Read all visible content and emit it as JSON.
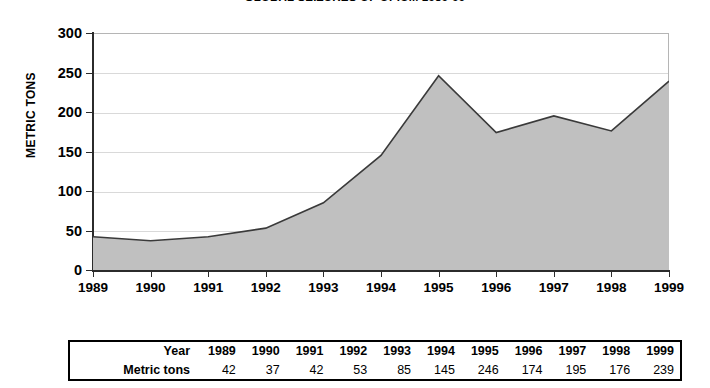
{
  "chart_data": {
    "type": "area",
    "title": "GLOBAL SEIZURES OF OPIUM 1989-99",
    "xlabel": "",
    "ylabel": "METRIC TONS",
    "categories": [
      "1989",
      "1990",
      "1991",
      "1992",
      "1993",
      "1994",
      "1995",
      "1996",
      "1997",
      "1998",
      "1999"
    ],
    "values": [
      42,
      37,
      42,
      53,
      85,
      145,
      246,
      174,
      195,
      176,
      239
    ],
    "series": [
      {
        "name": "Metric tons",
        "values": [
          42,
          37,
          42,
          53,
          85,
          145,
          246,
          174,
          195,
          176,
          239
        ]
      }
    ],
    "ylim": [
      0,
      300
    ],
    "y_ticks": [
      "0",
      "50",
      "100",
      "150",
      "200",
      "250",
      "300"
    ],
    "grid": true,
    "legend": "none",
    "fill_color": "#c0c0c0",
    "line_color": "#3a3a3a",
    "grid_color": "#d9d9d9",
    "axis_color": "#2b2b2b"
  },
  "table": {
    "row_labels": [
      "Year",
      "Metric tons"
    ],
    "years": [
      "1989",
      "1990",
      "1991",
      "1992",
      "1993",
      "1994",
      "1995",
      "1996",
      "1997",
      "1998",
      "1999"
    ],
    "metric_tons": [
      "42",
      "37",
      "42",
      "53",
      "85",
      "145",
      "246",
      "174",
      "195",
      "176",
      "239"
    ]
  }
}
